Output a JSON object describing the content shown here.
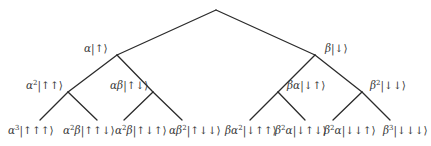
{
  "diagram": {
    "type": "binary-tree",
    "edge_color": "#2b2b2b",
    "text_color": "#3a3a3a",
    "nodes": {
      "root": {
        "x": 216,
        "y": 10,
        "label": ""
      },
      "a": {
        "x": 117,
        "y": 55,
        "label": "α|↑⟩",
        "coef": "α",
        "coef_exp": "",
        "coef2": "",
        "coef2_exp": "",
        "ket": "|↑⟩",
        "lx": 84,
        "ly": 43
      },
      "b": {
        "x": 315,
        "y": 55,
        "label": "β|↓⟩",
        "coef": "β",
        "coef_exp": "",
        "coef2": "",
        "coef2_exp": "",
        "ket": "|↓⟩",
        "lx": 325,
        "ly": 43
      },
      "aa": {
        "x": 68,
        "y": 92,
        "label": "α²|↑↑⟩",
        "coef": "α",
        "coef_exp": "2",
        "coef2": "",
        "coef2_exp": "",
        "ket": "|↑↑⟩",
        "lx": 26,
        "ly": 80
      },
      "ab": {
        "x": 153,
        "y": 92,
        "label": "αβ|↑↓⟩",
        "coef": "α",
        "coef_exp": "",
        "coef2": "β",
        "coef2_exp": "",
        "ket": "|↑↓⟩",
        "lx": 110,
        "ly": 80
      },
      "ba": {
        "x": 278,
        "y": 92,
        "label": "βα|↓↑⟩",
        "coef": "β",
        "coef_exp": "",
        "coef2": "α",
        "coef2_exp": "",
        "ket": "|↓↑⟩",
        "lx": 287,
        "ly": 80
      },
      "bb": {
        "x": 362,
        "y": 92,
        "label": "β²|↓↓⟩",
        "coef": "β",
        "coef_exp": "2",
        "coef2": "",
        "coef2_exp": "",
        "ket": "|↓↓⟩",
        "lx": 370,
        "ly": 80
      }
    },
    "leaves": [
      {
        "x": 40,
        "y": 120,
        "label": "α³|↑↑↑⟩",
        "coef": "α",
        "coef_exp": "3",
        "coef2": "",
        "coef2_exp": "",
        "ket": "|↑↑↑⟩",
        "lx": 8,
        "ly": 125
      },
      {
        "x": 97,
        "y": 120,
        "label": "α²β|↑↑↓⟩",
        "coef": "α",
        "coef_exp": "2",
        "coef2": "β",
        "coef2_exp": "",
        "ket": "|↑↑↓⟩",
        "lx": 63,
        "ly": 125
      },
      {
        "x": 124,
        "y": 120,
        "label": "α²β|↑↓↑⟩",
        "coef": "α",
        "coef_exp": "2",
        "coef2": "β",
        "coef2_exp": "",
        "ket": "|↑↓↑⟩",
        "lx": 115,
        "ly": 125
      },
      {
        "x": 182,
        "y": 120,
        "label": "αβ²|↑↓↓⟩",
        "coef": "α",
        "coef_exp": "",
        "coef2": "β",
        "coef2_exp": "2",
        "ket": "|↑↓↓⟩",
        "lx": 169,
        "ly": 125
      },
      {
        "x": 250,
        "y": 120,
        "label": "βα²|↓↑↑⟩",
        "coef": "β",
        "coef_exp": "",
        "coef2": "α",
        "coef2_exp": "2",
        "ket": "|↓↑↑⟩",
        "lx": 225,
        "ly": 125
      },
      {
        "x": 305,
        "y": 120,
        "label": "β²α|↓↑↓⟩",
        "coef": "β",
        "coef_exp": "2",
        "coef2": "α",
        "coef2_exp": "",
        "ket": "|↓↑↓⟩",
        "lx": 275,
        "ly": 125
      },
      {
        "x": 333,
        "y": 120,
        "label": "β²α|↓↓↑⟩",
        "coef": "β",
        "coef_exp": "2",
        "coef2": "α",
        "coef2_exp": "",
        "ket": "|↓↓↑⟩",
        "lx": 324,
        "ly": 125
      },
      {
        "x": 390,
        "y": 120,
        "label": "β³|↓↓↓⟩",
        "coef": "β",
        "coef_exp": "3",
        "coef2": "",
        "coef2_exp": "",
        "ket": "|↓↓↓⟩",
        "lx": 383,
        "ly": 125
      }
    ],
    "edges": [
      [
        "root",
        "a"
      ],
      [
        "root",
        "b"
      ],
      [
        "a",
        "aa"
      ],
      [
        "a",
        "ab"
      ],
      [
        "b",
        "ba"
      ],
      [
        "b",
        "bb"
      ],
      [
        "aa",
        "leaf0"
      ],
      [
        "aa",
        "leaf1"
      ],
      [
        "ab",
        "leaf2"
      ],
      [
        "ab",
        "leaf3"
      ],
      [
        "ba",
        "leaf4"
      ],
      [
        "ba",
        "leaf5"
      ],
      [
        "bb",
        "leaf6"
      ],
      [
        "bb",
        "leaf7"
      ]
    ]
  }
}
